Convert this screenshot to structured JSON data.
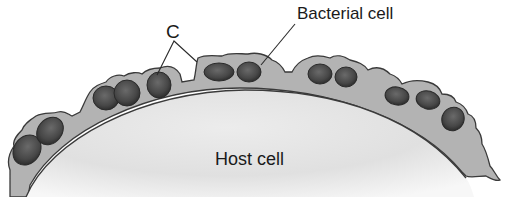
{
  "diagram": {
    "labels": {
      "c": "C",
      "bacterial_cell": "Bacterial cell",
      "host_cell": "Host cell"
    },
    "colors": {
      "background": "#ffffff",
      "host_cell_fill_light": "#f4f4f4",
      "host_cell_fill_dark": "#d9d9d9",
      "coating_fill": "#b3b3b3",
      "outline": "#3a3a3a",
      "bacterium_fill": "#4a4a4a",
      "bacterium_highlight": "#6e6e6e",
      "label_text": "#1a1a1a"
    },
    "elements": [
      {
        "id": "host-cell",
        "type": "large ellipse (host cell surface)"
      },
      {
        "id": "coating-layer",
        "type": "gray extracellular coating (glycocalyx) on host surface"
      },
      {
        "id": "bacteria",
        "count": 15,
        "type": "dark oval bacterial cells embedded in coating"
      },
      {
        "id": "leader-c",
        "points_to": [
          "bacterium",
          "coating layer"
        ]
      },
      {
        "id": "leader-bacterial-cell",
        "points_to": "bacterium"
      }
    ]
  }
}
